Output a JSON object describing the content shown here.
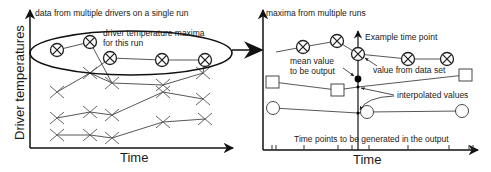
{
  "left_panel": {
    "title": "data from multiple drivers on a single run",
    "y_axis_label": "Driver temperatures",
    "x_axis_label": "Time",
    "ellipse_label_line1": "driver temperature maxima",
    "ellipse_label_line2": "for this run",
    "maxima_points": [
      [
        57,
        50
      ],
      [
        90,
        42
      ],
      [
        110,
        58
      ],
      [
        162,
        60
      ],
      [
        205,
        60
      ]
    ],
    "driver_series": [
      [
        [
          57,
          92
        ],
        [
          90,
          73
        ],
        [
          112,
          83
        ],
        [
          163,
          85
        ],
        [
          203,
          73
        ]
      ],
      [
        [
          57,
          118
        ],
        [
          90,
          112
        ],
        [
          112,
          115
        ],
        [
          163,
          92
        ],
        [
          203,
          99
        ]
      ],
      [
        [
          57,
          135
        ],
        [
          90,
          135
        ],
        [
          112,
          138
        ],
        [
          163,
          122
        ],
        [
          205,
          119
        ]
      ]
    ]
  },
  "right_panel": {
    "title": "maxima from multiple runs",
    "x_axis_label": "Time",
    "example_time_point_label": "Example time point",
    "mean_value_label_line1": "mean value",
    "mean_value_label_line2": "to be output",
    "value_from_data_set_label": "value from data set",
    "interpolated_values_label": "interpolated values",
    "time_points_label": "Time points to be generated in the output",
    "circled_x_series": [
      [
        303,
        47
      ],
      [
        337,
        41
      ],
      [
        358,
        54
      ],
      [
        408,
        59
      ],
      [
        447,
        59
      ]
    ],
    "square_series": [
      [
        273,
        82
      ],
      [
        337,
        90
      ],
      [
        465,
        75
      ]
    ],
    "circle_series": [
      [
        273,
        108
      ],
      [
        367,
        112
      ],
      [
        462,
        111
      ]
    ],
    "tick_positions": [
      272,
      276,
      304,
      338,
      352,
      358,
      369,
      408,
      449,
      469,
      473
    ]
  }
}
